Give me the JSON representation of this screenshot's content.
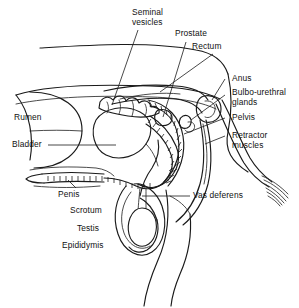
{
  "figure": {
    "type": "anatomical-line-diagram",
    "background_color": "#ffffff",
    "line_color": "#1a1a1a",
    "width": 299,
    "height": 308
  },
  "labels": {
    "seminal_vesicles": "Seminal\nvesicles",
    "seminal_vesicles_line1": "Seminal",
    "seminal_vesicles_line2": "vesicles",
    "prostate": "Prostate",
    "rectum": "Rectum",
    "anus": "Anus",
    "bulbo_urethral_glands_line1": "Bulbo-urethral",
    "bulbo_urethral_glands_line2": "glands",
    "pelvis": "Pelvis",
    "retractor_muscles_line1": "Retractor",
    "retractor_muscles_line2": "muscles",
    "vas_deferens": "Vas deferens",
    "rumen": "Rumen",
    "bladder": "Bladder",
    "penis": "Penis",
    "scrotum": "Scrotum",
    "testis": "Testis",
    "epididymis": "Epididymis"
  },
  "structures": [
    "body-outline",
    "rumen",
    "bladder",
    "seminal-vesicles",
    "prostate",
    "rectum",
    "anus",
    "bulbo-urethral-glands",
    "pelvis",
    "retractor-muscles",
    "vas-deferens",
    "penis",
    "sigmoid-flexure",
    "scrotum",
    "testis",
    "epididymis",
    "tail",
    "hind-legs"
  ]
}
